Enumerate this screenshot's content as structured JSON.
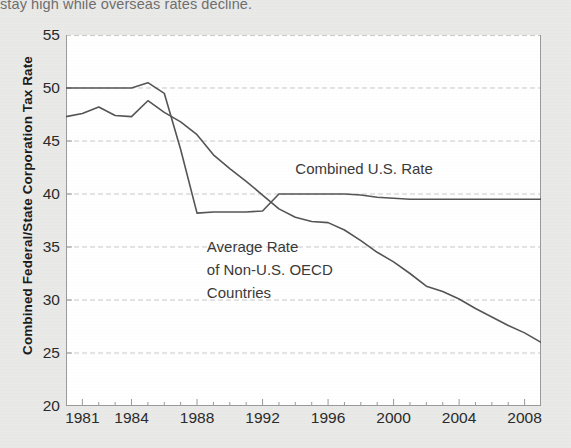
{
  "caption": {
    "tail_text": "stay high while overseas rates decline."
  },
  "axes": {
    "ylabel": "Combined Federal/State Corporation Tax Rate",
    "yticks": [
      55,
      50,
      45,
      40,
      35,
      30,
      25,
      20
    ],
    "xticks": [
      1981,
      1984,
      1988,
      1992,
      1996,
      2000,
      2004,
      2008
    ]
  },
  "annotations": {
    "us": "Combined U.S. Rate",
    "oecd_line1": "Average Rate",
    "oecd_line2": "of Non-U.S. OECD",
    "oecd_line3": "Countries"
  },
  "colors": {
    "page_background": "#e9e9e7",
    "plot_background": "#ffffff",
    "line": "#555555",
    "grid": "#c9c9c9",
    "axis": "#9a9a9a",
    "text": "#2b2b2b"
  },
  "chart_data": {
    "type": "line",
    "title": "",
    "xlabel": "",
    "ylabel": "Combined Federal/State Corporation Tax Rate",
    "xlim": [
      1980,
      2009
    ],
    "ylim": [
      20,
      55
    ],
    "ytick_step": 5,
    "grid": true,
    "legend": "inline-annotations",
    "x": [
      1980,
      1981,
      1982,
      1983,
      1984,
      1985,
      1986,
      1987,
      1988,
      1989,
      1990,
      1991,
      1992,
      1993,
      1994,
      1995,
      1996,
      1997,
      1998,
      1999,
      2000,
      2001,
      2002,
      2003,
      2004,
      2005,
      2006,
      2007,
      2008,
      2009
    ],
    "series": [
      {
        "name": "Combined U.S. Rate",
        "values": [
          50.0,
          50.0,
          50.0,
          50.0,
          50.0,
          50.5,
          49.5,
          44.2,
          38.2,
          38.3,
          38.3,
          38.3,
          38.4,
          40.0,
          40.0,
          40.0,
          40.0,
          40.0,
          39.9,
          39.7,
          39.6,
          39.5,
          39.5,
          39.5,
          39.5,
          39.5,
          39.5,
          39.5,
          39.5,
          39.5
        ]
      },
      {
        "name": "Average Rate of Non-U.S. OECD Countries",
        "values": [
          47.3,
          47.6,
          48.2,
          47.4,
          47.3,
          48.8,
          47.7,
          46.8,
          45.6,
          43.7,
          42.4,
          41.2,
          39.9,
          38.6,
          37.8,
          37.4,
          37.3,
          36.6,
          35.6,
          34.5,
          33.6,
          32.5,
          31.3,
          30.8,
          30.1,
          29.2,
          28.4,
          27.6,
          26.9,
          26.0
        ]
      }
    ]
  }
}
